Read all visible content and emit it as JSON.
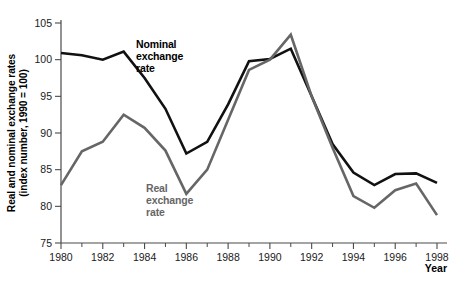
{
  "chart_data": {
    "type": "line",
    "title": "",
    "xlabel": "Year",
    "ylabel": "Real and nominal exchange rates (index number, 1990 = 100)",
    "ylabel_line1": "Real and nominal exchange rates",
    "ylabel_line2": "(index number, 1990 = 100)",
    "xlim": [
      1980,
      1998
    ],
    "ylim": [
      75,
      105
    ],
    "grid": false,
    "legend_position": "inline-annotations",
    "x": [
      1980,
      1981,
      1982,
      1983,
      1984,
      1985,
      1986,
      1987,
      1988,
      1989,
      1990,
      1991,
      1992,
      1993,
      1994,
      1995,
      1996,
      1997,
      1998
    ],
    "xticks": [
      1980,
      1982,
      1984,
      1986,
      1988,
      1990,
      1992,
      1994,
      1996,
      1998
    ],
    "xticklabels": [
      "1980",
      "1982",
      "1984",
      "1986",
      "1988",
      "1990",
      "1992",
      "1994",
      "1996",
      "1998"
    ],
    "xminorticks": [
      1981,
      1983,
      1985,
      1987,
      1989,
      1991,
      1993,
      1995,
      1997
    ],
    "yticks": [
      75,
      80,
      85,
      90,
      95,
      100,
      105
    ],
    "yticklabels": [
      "75",
      "80",
      "85",
      "90",
      "95",
      "100",
      "105"
    ],
    "series": [
      {
        "name": "Nominal exchange rate",
        "color": "#111111",
        "width": 2.6,
        "annotation": [
          "Nominal",
          "exchange",
          "rate"
        ],
        "values": [
          100.9,
          100.6,
          100.0,
          101.1,
          97.5,
          93.3,
          87.2,
          88.8,
          93.9,
          99.8,
          100.1,
          101.5,
          95.0,
          88.5,
          84.6,
          82.9,
          84.4,
          84.5,
          83.2
        ]
      },
      {
        "name": "Real exchange rate",
        "color": "#666666",
        "width": 2.6,
        "annotation": [
          "Real",
          "exchange",
          "rate"
        ],
        "values": [
          82.9,
          87.5,
          88.8,
          92.5,
          90.7,
          87.6,
          81.7,
          85.0,
          91.8,
          98.6,
          100.0,
          103.4,
          95.0,
          88.0,
          81.4,
          79.8,
          82.2,
          83.1,
          78.8
        ]
      }
    ]
  }
}
